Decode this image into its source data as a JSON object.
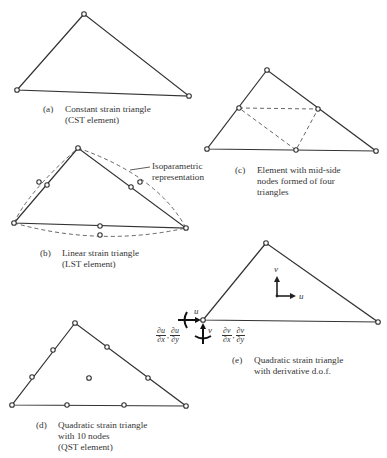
{
  "figure": {
    "panels": {
      "a": {
        "label": "(a)",
        "caption_lines": [
          "Constant strain triangle",
          "(CST element)"
        ]
      },
      "b": {
        "label": "(b)",
        "caption_lines": [
          "Linear strain triangle",
          "(LST element)"
        ],
        "annotation_lines": [
          "Isoparametric",
          "representation"
        ]
      },
      "c": {
        "label": "(c)",
        "caption_lines": [
          "Element with mid-side",
          "nodes formed of four",
          "triangles"
        ]
      },
      "d": {
        "label": "(d)",
        "caption_lines": [
          "Quadratic strain triangle",
          "with 10 nodes",
          "(QST element)"
        ]
      },
      "e": {
        "label": "(e)",
        "caption_lines": [
          "Quadratic strain triangle",
          "with derivative d.o.f."
        ],
        "axis_labels": {
          "u": "u",
          "v": "v"
        },
        "derivatives": {
          "u": [
            {
              "num": "∂u",
              "den": "∂x"
            },
            {
              "num": "∂u",
              "den": "∂y"
            }
          ],
          "v": [
            {
              "num": "∂v",
              "den": "∂x"
            },
            {
              "num": "∂v",
              "den": "∂y"
            }
          ]
        }
      }
    }
  }
}
